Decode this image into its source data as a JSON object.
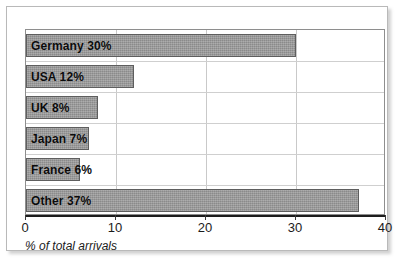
{
  "chart_data": {
    "type": "bar",
    "orientation": "horizontal",
    "title": "",
    "subtitle": "",
    "xlabel": "% of total arrivals",
    "ylabel": "",
    "categories": [
      "Germany",
      "USA",
      "UK",
      "Japan",
      "France",
      "Other"
    ],
    "values": [
      30,
      12,
      8,
      7,
      6,
      37
    ],
    "bar_labels": [
      "Germany 30%",
      "USA 12%",
      "UK 8%",
      "Japan 7%",
      "France 6%",
      "Other 37%"
    ],
    "xlim": [
      0,
      40
    ],
    "xticks": [
      0,
      10,
      20,
      30,
      40
    ],
    "xtick_labels": [
      "0",
      "10",
      "20",
      "30",
      "40"
    ],
    "grid": "vertical",
    "legend": "none",
    "series": [
      {
        "name": "% of total arrivals",
        "values": [
          30,
          12,
          8,
          7,
          6,
          37
        ]
      }
    ],
    "colors": {
      "bar_fill": "#9b9b9b",
      "bar_stroke": "#5e5e5e",
      "grid": "#c9c9c9",
      "axis": "#1d1d1d",
      "plot_border": "#8e8e8e",
      "panel_border": "#b9b9b9",
      "text": "#0b0b0b",
      "background": "#ffffff"
    }
  },
  "caption": "% of total arrivals"
}
